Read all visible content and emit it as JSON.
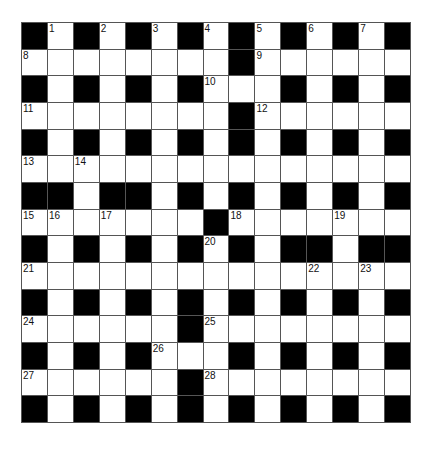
{
  "puzzle": {
    "size": {
      "rows": 15,
      "cols": 15
    },
    "colors": {
      "black_square": "#000000",
      "white_square": "#ffffff",
      "grid_line": "#555555",
      "number_text": "#111111"
    },
    "grid": [
      "#.#.#.#.#.#.#.#",
      "........#......",
      "#.#.#.#...#.#.#",
      "........#......",
      "#.#.#.#.#.#.#.#",
      "...............",
      "##.##.#.#.#.#.#",
      ".......#.......",
      "#.#.#.#.#.##.##",
      "...............",
      "#.#.#.#.#.#.#.#",
      "......#........",
      "#.#.#...#.#.#.#",
      "......#........",
      "#.#.#.#.#.#.#.#"
    ],
    "numbers": [
      {
        "n": "1",
        "row": 0,
        "col": 1
      },
      {
        "n": "2",
        "row": 0,
        "col": 3
      },
      {
        "n": "3",
        "row": 0,
        "col": 5
      },
      {
        "n": "4",
        "row": 0,
        "col": 7
      },
      {
        "n": "5",
        "row": 0,
        "col": 9
      },
      {
        "n": "6",
        "row": 0,
        "col": 11
      },
      {
        "n": "7",
        "row": 0,
        "col": 13
      },
      {
        "n": "8",
        "row": 1,
        "col": 0
      },
      {
        "n": "9",
        "row": 1,
        "col": 9
      },
      {
        "n": "10",
        "row": 2,
        "col": 7
      },
      {
        "n": "11",
        "row": 3,
        "col": 0
      },
      {
        "n": "12",
        "row": 3,
        "col": 9
      },
      {
        "n": "13",
        "row": 5,
        "col": 0
      },
      {
        "n": "14",
        "row": 5,
        "col": 2
      },
      {
        "n": "15",
        "row": 7,
        "col": 0
      },
      {
        "n": "16",
        "row": 7,
        "col": 1
      },
      {
        "n": "17",
        "row": 7,
        "col": 3
      },
      {
        "n": "18",
        "row": 7,
        "col": 8
      },
      {
        "n": "19",
        "row": 7,
        "col": 12
      },
      {
        "n": "20",
        "row": 8,
        "col": 7
      },
      {
        "n": "21",
        "row": 9,
        "col": 0
      },
      {
        "n": "22",
        "row": 9,
        "col": 11
      },
      {
        "n": "23",
        "row": 9,
        "col": 13
      },
      {
        "n": "24",
        "row": 11,
        "col": 0
      },
      {
        "n": "25",
        "row": 11,
        "col": 7
      },
      {
        "n": "26",
        "row": 12,
        "col": 5
      },
      {
        "n": "27",
        "row": 13,
        "col": 0
      },
      {
        "n": "28",
        "row": 13,
        "col": 7
      }
    ]
  }
}
